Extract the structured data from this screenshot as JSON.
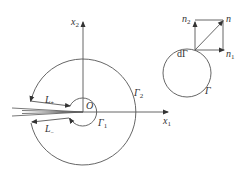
{
  "diagram": {
    "colors": {
      "stroke": "#555555",
      "text": "#333333",
      "background": "#ffffff"
    },
    "axes": {
      "x1": {
        "label": "x",
        "sub": "1"
      },
      "x2": {
        "label": "x",
        "sub": "2"
      },
      "origin": "O"
    },
    "contours": {
      "outer": {
        "label": "Γ",
        "sub": "2"
      },
      "inner": {
        "label": "Γ",
        "sub": "1"
      },
      "upper_crack_face": {
        "label": "L",
        "sub": "+"
      },
      "lower_crack_face": {
        "label": "L",
        "sub": "−"
      }
    },
    "inset": {
      "contour": {
        "label": "Γ"
      },
      "element": {
        "label": "dΓ"
      },
      "normal": {
        "label": "n"
      },
      "n1": {
        "label": "n",
        "sub": "1"
      },
      "n2": {
        "label": "n",
        "sub": "2"
      }
    }
  }
}
